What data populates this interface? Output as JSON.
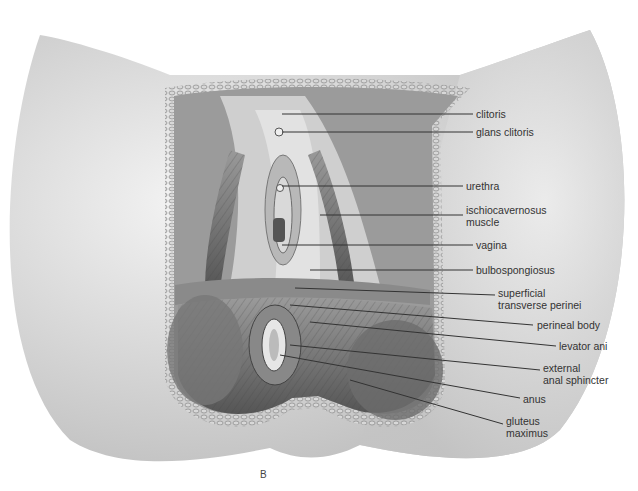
{
  "figure": {
    "panel_letter": "B"
  },
  "labels": [
    {
      "id": "clitoris",
      "text": "clitoris",
      "line2": ""
    },
    {
      "id": "glans",
      "text": "glans clitoris",
      "line2": ""
    },
    {
      "id": "urethra",
      "text": "urethra",
      "line2": ""
    },
    {
      "id": "ischio",
      "text": "ischiocavernosus",
      "line2": "muscle"
    },
    {
      "id": "vagina",
      "text": "vagina",
      "line2": ""
    },
    {
      "id": "bulbo",
      "text": "bulbospongiosus",
      "line2": ""
    },
    {
      "id": "stp",
      "text": "superficial",
      "line2": "transverse perinei"
    },
    {
      "id": "pb",
      "text": "perineal body",
      "line2": ""
    },
    {
      "id": "la",
      "text": "levator ani",
      "line2": ""
    },
    {
      "id": "eas",
      "text": "external",
      "line2": "anal sphincter"
    },
    {
      "id": "anus",
      "text": "anus",
      "line2": ""
    },
    {
      "id": "gm",
      "text": "gluteus",
      "line2": "maximus"
    }
  ],
  "colors": {
    "skin_light": "#e9e9e9",
    "skin_mid": "#cfcfcf",
    "muscle_dark": "#6e6e6e",
    "muscle_mid": "#8c8c8c",
    "fat_border": "#b9b9b9",
    "leader_line": "#333333"
  }
}
